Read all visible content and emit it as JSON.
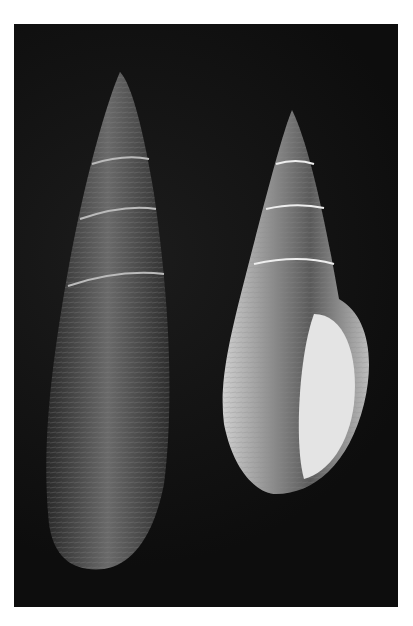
{
  "image": {
    "description": "Two spiral gastropod shells photographed on a black background",
    "subjects": [
      {
        "name": "left-shell",
        "note": "elongated, dark, finely ribbed spire"
      },
      {
        "name": "right-shell",
        "note": "banded spire with pale aperture facing viewer"
      }
    ],
    "colors": {
      "background": "#111111",
      "frame": "#ffffff",
      "shell_dark": "#3a3a3a",
      "shell_light": "#d8d8d8"
    }
  }
}
